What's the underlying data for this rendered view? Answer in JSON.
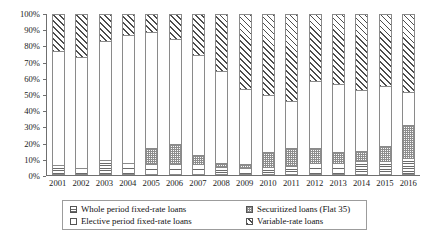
{
  "chart_data": {
    "type": "bar",
    "subtype": "stacked-100-percent",
    "title": "",
    "xlabel": "",
    "ylabel": "",
    "ylim": [
      0,
      100
    ],
    "yticks": [
      "0%",
      "10%",
      "20%",
      "30%",
      "40%",
      "50%",
      "60%",
      "70%",
      "80%",
      "90%",
      "100%"
    ],
    "ytick_values": [
      0,
      10,
      20,
      30,
      40,
      50,
      60,
      70,
      80,
      90,
      100
    ],
    "grid": false,
    "legend_position": "bottom",
    "categories": [
      "2001",
      "2002",
      "2003",
      "2004",
      "2005",
      "2006",
      "2007",
      "2008",
      "2009",
      "2010",
      "2011",
      "2012",
      "2013",
      "2014",
      "2015",
      "2016"
    ],
    "series": [
      {
        "name": "Whole period fixed-rate loans",
        "pattern": "horizontal-lines",
        "values": [
          5,
          3,
          8.5,
          6.5,
          5.5,
          5.5,
          5.5,
          3.5,
          3,
          4,
          4.5,
          6.5,
          6.5,
          7.5,
          7.5,
          9.5
        ]
      },
      {
        "name": "Securitized loans (Flat 35)",
        "pattern": "checker",
        "values": [
          0,
          0,
          0,
          0,
          10,
          13,
          6,
          2.5,
          2.5,
          9,
          11,
          9.5,
          6.5,
          6.5,
          9.5,
          20.5
        ]
      },
      {
        "name": "Elective period fixed-rate loans",
        "pattern": "blank",
        "values": [
          72,
          70,
          74.5,
          80,
          73.5,
          65.5,
          63,
          58,
          47.5,
          36,
          30,
          42,
          43,
          38,
          38,
          21
        ]
      },
      {
        "name": "Variable-rate loans",
        "pattern": "diagonal-hatch",
        "values": [
          23,
          27,
          17,
          13.5,
          11,
          16,
          25.5,
          36,
          47,
          51,
          54.5,
          42,
          44,
          48,
          45,
          49
        ]
      }
    ]
  },
  "axis": {
    "y_tick_labels": [
      "100%",
      "90%",
      "80%",
      "70%",
      "60%",
      "50%",
      "40%",
      "30%",
      "20%",
      "10%",
      "0%"
    ],
    "x_tick_labels": [
      "2001",
      "2002",
      "2003",
      "2004",
      "2005",
      "2006",
      "2007",
      "2008",
      "2009",
      "2010",
      "2011",
      "2012",
      "2013",
      "2014",
      "2015",
      "2016"
    ]
  },
  "legend": {
    "rows": [
      {
        "left": "Whole period fixed-rate loans",
        "right": "Securitized loans (Flat 35)"
      },
      {
        "left": "Elective period fixed-rate loans",
        "right": "Variable-rate loans"
      }
    ],
    "items": [
      {
        "label": "Whole period fixed-rate loans",
        "pattern": "horizontal-lines"
      },
      {
        "label": "Securitized loans (Flat 35)",
        "pattern": "checker"
      },
      {
        "label": "Elective period fixed-rate loans",
        "pattern": "blank"
      },
      {
        "label": "Variable-rate loans",
        "pattern": "diagonal-hatch"
      }
    ]
  },
  "colors": {
    "axis": "#6f6f6f",
    "bar_outline": "#8a8a8a",
    "pattern_ink": "#4d4d4d",
    "text": "#1a1a1a",
    "background": "#ffffff"
  }
}
